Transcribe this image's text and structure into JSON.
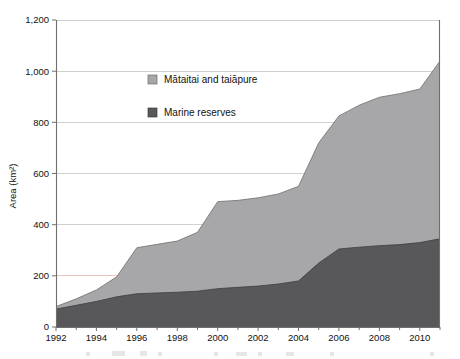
{
  "chart_data": {
    "type": "area",
    "stacked": true,
    "title": "",
    "subtitle": "",
    "xlabel": "",
    "ylabel": "Area (km²)",
    "xlim": [
      1992,
      2011
    ],
    "ylim": [
      0,
      1200
    ],
    "y_ticks": [
      0,
      200,
      400,
      600,
      800,
      1000,
      1200
    ],
    "y_tick_labels": [
      "0",
      "200",
      "400",
      "600",
      "800",
      "1,000",
      "1,200"
    ],
    "x_ticks": [
      1992,
      1994,
      1996,
      1998,
      2000,
      2002,
      2004,
      2006,
      2008,
      2010
    ],
    "x_tick_labels": [
      "1992",
      "1994",
      "1996",
      "1998",
      "2000",
      "2002",
      "2004",
      "2006",
      "2008",
      "2010"
    ],
    "x_minor_ticks": [
      1993,
      1995,
      1997,
      1999,
      2001,
      2003,
      2005,
      2007,
      2009,
      2011
    ],
    "grid": "horizontal",
    "legend_position": "upper-center-left",
    "x": [
      1992,
      1993,
      1994,
      1995,
      1996,
      1997,
      1998,
      1999,
      2000,
      2001,
      2002,
      2003,
      2004,
      2005,
      2006,
      2007,
      2008,
      2009,
      2010,
      2011
    ],
    "series": [
      {
        "name": "Marine reserves",
        "color": "#58585a",
        "values": [
          70,
          85,
          100,
          118,
          130,
          133,
          136,
          140,
          150,
          155,
          160,
          168,
          180,
          250,
          305,
          312,
          318,
          322,
          330,
          345
        ]
      },
      {
        "name": "Mātaitai and taiāpure",
        "color": "#a7a7a9",
        "values": [
          10,
          25,
          45,
          78,
          180,
          190,
          200,
          230,
          340,
          340,
          345,
          352,
          370,
          470,
          520,
          555,
          580,
          590,
          600,
          695
        ]
      }
    ],
    "totals": [
      80,
      110,
      145,
      196,
      310,
      323,
      336,
      370,
      490,
      495,
      505,
      520,
      550,
      720,
      825,
      867,
      898,
      912,
      930,
      1040
    ]
  },
  "legend": {
    "entries": [
      {
        "label": "Mātaitai and taiāpure",
        "color": "#a7a7a9"
      },
      {
        "label": "Marine reserves",
        "color": "#58585a"
      }
    ]
  },
  "axes": {
    "y_title": "Area (km²)"
  }
}
